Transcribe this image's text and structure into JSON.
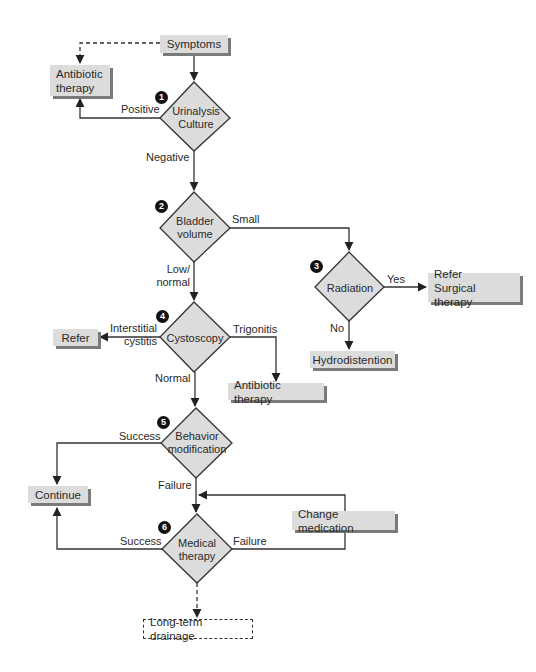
{
  "colors": {
    "node_fill": "#dcdcdc",
    "node_shadow": "#7a7a7a",
    "line": "#333333",
    "badge": "#111111"
  },
  "decisions": [
    {
      "id": "d1",
      "number": "1",
      "label": [
        "Urinalysis",
        "Culture"
      ]
    },
    {
      "id": "d2",
      "number": "2",
      "label": [
        "Bladder",
        "volume"
      ]
    },
    {
      "id": "d3",
      "number": "3",
      "label": [
        "Radiation"
      ]
    },
    {
      "id": "d4",
      "number": "4",
      "label": [
        "Cystoscopy"
      ]
    },
    {
      "id": "d5",
      "number": "5",
      "label": [
        "Behavior",
        "modification"
      ]
    },
    {
      "id": "d6",
      "number": "6",
      "label": [
        "Medical",
        "therapy"
      ]
    }
  ],
  "boxes": {
    "symptoms": [
      "Symptoms"
    ],
    "antibiotic_1": [
      "Antibiotic",
      "therapy"
    ],
    "refer_surgical": [
      "Refer",
      "Surgical therapy"
    ],
    "hydrodistention": [
      "Hydrodistention"
    ],
    "refer": [
      "Refer"
    ],
    "antibiotic_2": [
      "Antibiotic therapy"
    ],
    "continue": [
      "Continue"
    ],
    "change_medication": [
      "Change medication"
    ],
    "long_term_drainage": [
      "Long-term drainage"
    ]
  },
  "edges": {
    "positive": "Positive",
    "negative": "Negative",
    "small": "Small",
    "low_normal": [
      "Low/",
      "normal"
    ],
    "yes": "Yes",
    "no": "No",
    "interstitial_cystitis": [
      "Interstitial",
      "cystitis"
    ],
    "trigonitis": "Trigonitis",
    "normal": "Normal",
    "success_5": "Success",
    "failure_5": "Failure",
    "success_6": "Success",
    "failure_6": "Failure"
  }
}
